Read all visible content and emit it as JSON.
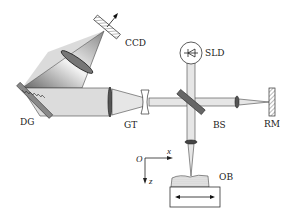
{
  "diagram": {
    "title": "",
    "components": [
      {
        "id": "CCD",
        "label": "CCD",
        "type": "camera"
      },
      {
        "id": "SLD",
        "label": "SLD",
        "type": "light-source"
      },
      {
        "id": "DG",
        "label": "DG",
        "type": "diffraction-grating"
      },
      {
        "id": "GT",
        "label": "GT",
        "type": "galilean-telescope"
      },
      {
        "id": "BS",
        "label": "BS",
        "type": "beam-splitter"
      },
      {
        "id": "RM",
        "label": "RM",
        "type": "reference-mirror"
      },
      {
        "id": "OB",
        "label": "OB",
        "type": "object"
      }
    ],
    "axes": {
      "origin": "O",
      "x": "x",
      "z": "z"
    },
    "colors": {
      "beam": "#d8d8d8",
      "stroke": "#333333",
      "background": "#ffffff"
    }
  }
}
